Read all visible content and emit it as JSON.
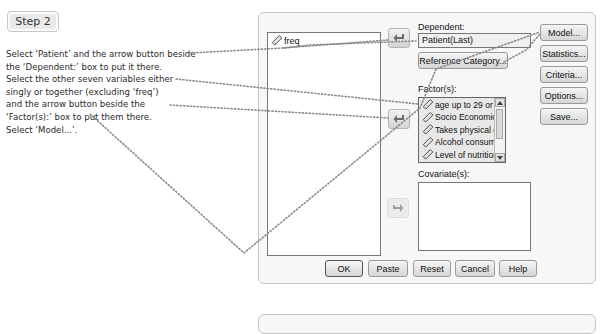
{
  "step": {
    "label": "Step 2"
  },
  "instructions": {
    "lines": [
      "Select ‘Patient’ and the arrow button beside",
      "the ‘Dependent:’ box to put it there.",
      "Select the other seven variables either",
      "singly or together (excluding ‘freq’)",
      "and the arrow button beside the",
      "‘Factor(s):’ box to put them there.",
      "Select ‘Model...’."
    ]
  },
  "dialog": {
    "variables": [
      {
        "label": "freq",
        "icon": "scale-ruler-icon"
      }
    ],
    "dependent": {
      "label": "Dependent:",
      "value": "Patient(Last)"
    },
    "reference_category_button": "Reference Category...",
    "factors": {
      "label": "Factor(s):",
      "items": [
        "age up to 29 or 3...",
        "Socio Economic ...",
        "Takes physical e...",
        "Alcohol consump...",
        "Level of nutrition [..."
      ]
    },
    "covariates": {
      "label": "Covariate(s):"
    },
    "side_buttons": [
      "Model...",
      "Statistics...",
      "Criteria...",
      "Options...",
      "Save..."
    ],
    "bottom_buttons": [
      "OK",
      "Paste",
      "Reset",
      "Cancel",
      "Help"
    ]
  },
  "colors": {
    "dotted_line": "#8a8a8a",
    "dialog_bg": "#f7f7f7",
    "field_border": "#777777"
  }
}
